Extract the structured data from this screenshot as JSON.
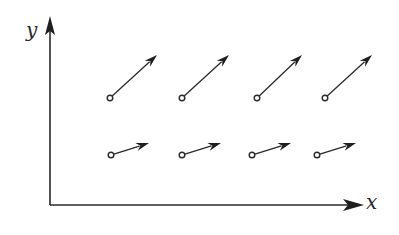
{
  "diagram": {
    "type": "vector-field",
    "axes": {
      "x_label": "x",
      "y_label": "y",
      "origin": [
        50,
        205
      ],
      "x_end": [
        362,
        205
      ],
      "y_end": [
        50,
        18
      ]
    },
    "rows": [
      {
        "name": "upper-row",
        "vectors": [
          {
            "start": [
              110,
              98
            ],
            "end": [
              157,
              55
            ]
          },
          {
            "start": [
              182,
              98
            ],
            "end": [
              229,
              55
            ]
          },
          {
            "start": [
              257,
              98
            ],
            "end": [
              302,
              55
            ]
          },
          {
            "start": [
              325,
              98
            ],
            "end": [
              372,
              55
            ]
          }
        ]
      },
      {
        "name": "lower-row",
        "vectors": [
          {
            "start": [
              111,
              155
            ],
            "end": [
              149,
              143
            ]
          },
          {
            "start": [
              182,
              155
            ],
            "end": [
              221,
              143
            ]
          },
          {
            "start": [
              252,
              155
            ],
            "end": [
              291,
              143
            ]
          },
          {
            "start": [
              317,
              155
            ],
            "end": [
              356,
              143
            ]
          }
        ]
      }
    ],
    "colors": {
      "ink": "#2a2a2a",
      "background": "#ffffff"
    }
  }
}
